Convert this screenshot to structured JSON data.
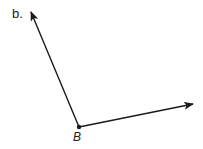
{
  "diagram": {
    "part_label": "b.",
    "vertex_label": "B",
    "vertex": {
      "x": 79,
      "y": 127
    },
    "rays": [
      {
        "name": "left-ray",
        "to": {
          "x": 31,
          "y": 12
        }
      },
      {
        "name": "right-ray",
        "to": {
          "x": 193,
          "y": 104
        }
      }
    ],
    "stroke_color": "#1a1a1a"
  }
}
